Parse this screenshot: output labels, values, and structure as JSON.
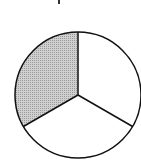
{
  "diagram": {
    "type": "fraction-circle",
    "parts": 3,
    "shaded_parts": 1,
    "shade_color": "#bdbdbd",
    "stroke_color": "#111111",
    "fill_color": "#ffffff"
  }
}
